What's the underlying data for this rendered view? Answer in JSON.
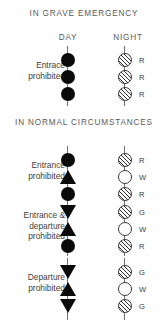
{
  "sections": {
    "grave": {
      "title": "IN GRAVE EMERGENCY",
      "columns": {
        "day": "DAY",
        "night": "NIGHT"
      },
      "rows": [
        {
          "label": "Entrace\nprohibited",
          "day_shapes": [
            "circle",
            "circle",
            "circle"
          ],
          "night_lamps": [
            {
              "fill": "hatched",
              "letter": "R"
            },
            {
              "fill": "hatched",
              "letter": "R"
            },
            {
              "fill": "hatched",
              "letter": "R"
            }
          ]
        }
      ]
    },
    "normal": {
      "title": "IN NORMAL CIRCUMSTANCES",
      "rows": [
        {
          "label": "Entrance\nprohibited",
          "day_shapes": [
            "circle",
            "triangle-up",
            "circle"
          ],
          "night_lamps": [
            {
              "fill": "hatched",
              "letter": "R"
            },
            {
              "fill": "white",
              "letter": "W"
            },
            {
              "fill": "hatched",
              "letter": "R"
            }
          ]
        },
        {
          "label": "Entrance &\ndeparture\nprohibited",
          "day_shapes": [
            "triangle-down",
            "triangle-up",
            "circle"
          ],
          "night_lamps": [
            {
              "fill": "hatched",
              "letter": "G"
            },
            {
              "fill": "white",
              "letter": "W"
            },
            {
              "fill": "hatched",
              "letter": "R"
            }
          ]
        },
        {
          "label": "Departure\nprohibited",
          "day_shapes": [
            "triangle-down",
            "triangle-up",
            "triangle-down"
          ],
          "night_lamps": [
            {
              "fill": "hatched",
              "letter": "G"
            },
            {
              "fill": "white",
              "letter": "W"
            },
            {
              "fill": "hatched",
              "letter": "G"
            }
          ]
        }
      ]
    }
  },
  "colors": {
    "ink": "#0b0b0b",
    "text": "#4a4a4a",
    "pole": "#6f6f6f",
    "lamp_outline": "#3a3a3a"
  }
}
